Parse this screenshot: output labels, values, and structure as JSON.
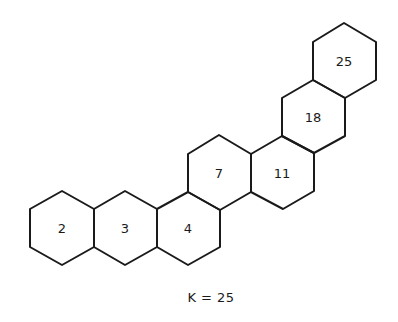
{
  "diagram": {
    "type": "hexagonal-ring-chain",
    "caption": "K = 25",
    "stroke_color": "#1a1a1a",
    "rings": [
      {
        "label": "2",
        "cx": 62,
        "cy": 228
      },
      {
        "label": "3",
        "cx": 125,
        "cy": 228
      },
      {
        "label": "4",
        "cx": 188,
        "cy": 228
      },
      {
        "label": "7",
        "cx": 219,
        "cy": 173
      },
      {
        "label": "11",
        "cx": 282,
        "cy": 173
      },
      {
        "label": "18",
        "cx": 313,
        "cy": 117
      },
      {
        "label": "25",
        "cx": 345,
        "cy": 61
      }
    ]
  }
}
